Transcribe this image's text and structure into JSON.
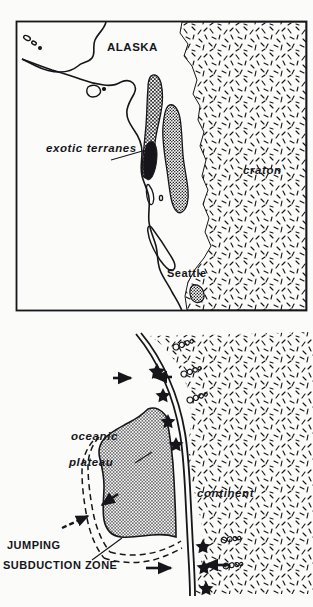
{
  "figure": {
    "background_color": "#fbfbfa",
    "ink_color": "#16161a"
  },
  "panel_top": {
    "name": "map-panel",
    "frame": {
      "x": 16,
      "y": 21,
      "width": 291,
      "height": 290,
      "border_color": "#16161a"
    },
    "labels": {
      "alaska": "ALASKA",
      "craton": "craton",
      "exotic_terranes": "exotic terranes",
      "seattle": "Seattle"
    },
    "legend_shapes": [
      {
        "name": "exotic-terrane-crosshatch",
        "fill": "crosshatch"
      },
      {
        "name": "exotic-terrane-gray",
        "fill": "gray-stipple"
      },
      {
        "name": "craton-dash-stipple",
        "fill": "dash-stipple"
      }
    ]
  },
  "panel_bottom": {
    "name": "subduction-diagram-panel",
    "labels": {
      "oceanic": "oceanic",
      "plateau": "plateau",
      "continent": "continent",
      "jumping": "JUMPING",
      "subduction_zone": "SUBDUCTION ZONE"
    },
    "symbols": {
      "volcano_star": "star-icon",
      "pluton_circles": "circle-cluster-icon",
      "motion_arrow": "arrow-icon",
      "dashed_new_trench": "dashed-line"
    },
    "arrow_count": 6,
    "star_count": 7
  }
}
